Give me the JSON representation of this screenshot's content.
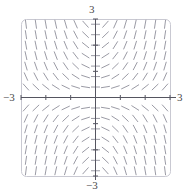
{
  "figure": {
    "kind": "slope-field",
    "frame": {
      "x": 21,
      "y": 19,
      "width": 149,
      "height": 157,
      "corner_radius": 5
    },
    "origin": {
      "x": 96,
      "y": 98
    },
    "colors": {
      "segment": "#8a8a96",
      "axis": "#555560",
      "frame": "#c9c9d2",
      "label": "#4a4a4a",
      "background": "#ffffff"
    },
    "labels": {
      "top": "3",
      "bottom": "−3",
      "left": "−3",
      "right": "3"
    }
  },
  "chart_data": {
    "type": "scatter",
    "subtype": "slope-field",
    "title": "",
    "xlabel": "",
    "ylabel": "",
    "xlim": [
      -3,
      3
    ],
    "ylim": [
      -3,
      3
    ],
    "xticks": [
      -3,
      -2,
      -1,
      0,
      1,
      2,
      3
    ],
    "yticks": [
      -3,
      -2,
      -1,
      0,
      1,
      2,
      3
    ],
    "tick_labels": {
      "x": [
        "−3",
        "",
        "",
        "",
        "",
        "",
        "3"
      ],
      "y": [
        "−3",
        "",
        "",
        "",
        "",
        "",
        "3"
      ]
    },
    "grid": false,
    "legend": null,
    "axes_style": "centered-crosshair-with-rounded-frame",
    "slope_formula": "dy/dx = x*y",
    "grid_resolution": {
      "nx": 15,
      "ny": 15
    },
    "sample_step": 0.42857,
    "segment_length_px": 9,
    "sample_slopes": [
      {
        "x": -3,
        "y": 3,
        "slope": -9
      },
      {
        "x": -3,
        "y": 0,
        "slope": 0
      },
      {
        "x": -3,
        "y": -3,
        "slope": 9
      },
      {
        "x": -1.5,
        "y": 1.5,
        "slope": -2.25
      },
      {
        "x": -1,
        "y": 1,
        "slope": -1
      },
      {
        "x": -0.5,
        "y": 0.5,
        "slope": -0.25
      },
      {
        "x": 0,
        "y": 3,
        "slope": 0
      },
      {
        "x": 0,
        "y": 0,
        "slope": 0
      },
      {
        "x": 0,
        "y": -3,
        "slope": 0
      },
      {
        "x": 0.5,
        "y": 0.5,
        "slope": 0.25
      },
      {
        "x": 1,
        "y": 1,
        "slope": 1
      },
      {
        "x": 1.5,
        "y": 1.5,
        "slope": 2.25
      },
      {
        "x": 3,
        "y": 3,
        "slope": 9
      },
      {
        "x": 3,
        "y": 0,
        "slope": 0
      },
      {
        "x": 3,
        "y": -3,
        "slope": -9
      }
    ]
  }
}
